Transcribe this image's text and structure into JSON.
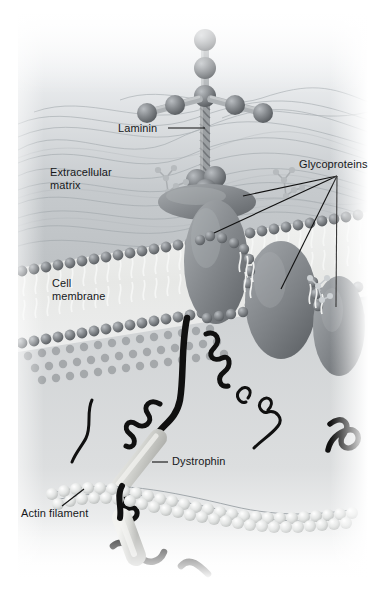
{
  "figure": {
    "width": 386,
    "height": 608,
    "background": "#ffffff"
  },
  "palette": {
    "page_background": "#ffffff",
    "extracellular_matrix": "#c9cdd0",
    "matrix_fiber": "#9aa0a5",
    "cytoplasm": "#d3d6d8",
    "protein_gray": "#8d9195",
    "protein_dark": "#6e7276",
    "protein_light": "#b4b8bb",
    "lipid_head": "#8b9095",
    "lipid_tail": "#f2f3f2",
    "membrane_core": "#e6e7e6",
    "actin_bead": "#e3e5e5",
    "dystrophin_black": "#101010",
    "rod_light": "#d8d9d6",
    "label_text": "#16181a",
    "leader_line": "#101010",
    "sphere_gray": "#7d8287"
  },
  "labels": [
    {
      "id": "laminin",
      "name": "label-laminin",
      "text": "Laminin",
      "x": 118,
      "y": 122,
      "leader": {
        "type": "line",
        "x1": 168,
        "y1": 128,
        "x2": 205,
        "y2": 128
      }
    },
    {
      "id": "extracellular-matrix",
      "name": "label-extracellular-matrix",
      "text": "Extracellular\nmatrix",
      "x": 50,
      "y": 166,
      "leader": null
    },
    {
      "id": "glycoproteins",
      "name": "label-glycoproteins",
      "text": "Glycoproteins",
      "x": 299,
      "y": 158,
      "leader": {
        "type": "fan",
        "hub_x": 337,
        "hub_y": 176
      }
    },
    {
      "id": "cell-membrane",
      "name": "label-cell-membrane",
      "text": "Cell\nmembrane",
      "x": 52,
      "y": 277,
      "leader": null
    },
    {
      "id": "dystrophin",
      "name": "label-dystrophin",
      "text": "Dystrophin",
      "x": 172,
      "y": 455,
      "leader": {
        "type": "line",
        "x1": 152,
        "y1": 462,
        "x2": 168,
        "y2": 462
      }
    },
    {
      "id": "actin-filament",
      "name": "label-actin-filament",
      "text": "Actin filament",
      "x": 21,
      "y": 507,
      "leader": {
        "type": "line",
        "x1": 62,
        "y1": 506,
        "x2": 84,
        "y2": 489
      }
    }
  ],
  "structures": {
    "laminin": {
      "name": "laminin-molecule",
      "description": "Cross-shaped molecule with beaded arms above a coiled stalk",
      "stalk": {
        "x": 205,
        "y_top": 96,
        "y_bottom": 178
      },
      "vertical_arm_beads": 3,
      "left_arm_beads": 2,
      "right_arm_beads": 2
    },
    "glycoprotein_targets": [
      {
        "name": "dystroglycan-disc",
        "x": 243,
        "y": 196
      },
      {
        "name": "glycoprotein-tall-left",
        "x": 214,
        "y": 233
      },
      {
        "name": "glycoprotein-middle",
        "x": 281,
        "y": 289
      },
      {
        "name": "glycoprotein-right",
        "x": 336,
        "y": 307
      }
    ],
    "membrane": {
      "name": "lipid-bilayer",
      "leaflets": 2,
      "description": "Phospholipid bilayer drawn in perspective with bead head-groups and wavy tails"
    },
    "actin_filament": {
      "name": "actin-filament",
      "description": "Double-helical string of globular actin beads running left to right"
    },
    "dystrophin": {
      "name": "dystrophin-rod",
      "description": "Light rod segments joined by thick black coiled linker strands"
    }
  }
}
